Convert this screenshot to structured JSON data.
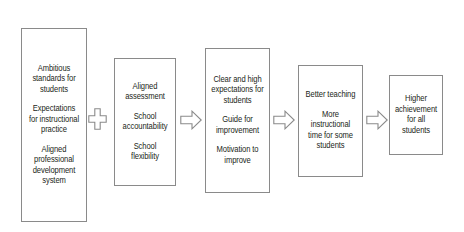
{
  "diagram": {
    "background": "#ffffff",
    "border_color": "#8a8a8a",
    "text_color": "#231f20",
    "nodes": [
      {
        "id": "inputs",
        "name": "ambitious-standards-box",
        "groups": [
          {
            "lines": [
              "Ambitious",
              "standards for",
              "students"
            ]
          },
          {
            "lines": [
              "Expectations",
              "for instructional",
              "practice"
            ]
          },
          {
            "lines": [
              "Aligned",
              "professional",
              "development",
              "system"
            ]
          }
        ]
      },
      {
        "id": "accountability",
        "name": "aligned-assessment-box",
        "groups": [
          {
            "lines": [
              "Aligned",
              "assessment"
            ]
          },
          {
            "lines": [
              "School",
              "accountability"
            ]
          },
          {
            "lines": [
              "School",
              "flexibility"
            ]
          }
        ]
      },
      {
        "id": "expectations",
        "name": "clear-expectations-box",
        "groups": [
          {
            "lines": [
              "Clear and high",
              "expectations for",
              "students"
            ]
          },
          {
            "lines": [
              "Guide for",
              "improvement"
            ]
          },
          {
            "lines": [
              "Motivation to",
              "improve"
            ]
          }
        ]
      },
      {
        "id": "teaching",
        "name": "better-teaching-box",
        "groups": [
          {
            "lines": [
              "Better teaching"
            ]
          },
          {
            "lines": [
              "More",
              "instructional",
              "time for some",
              "students"
            ]
          }
        ]
      },
      {
        "id": "outcome",
        "name": "higher-achievement-box",
        "groups": [
          {
            "lines": [
              "Higher",
              "achievement",
              "for all",
              "students"
            ]
          }
        ]
      }
    ],
    "connectors": [
      {
        "id": "plus-1",
        "name": "plus-connector",
        "glyph": "plus",
        "label": "plus"
      },
      {
        "id": "arrow-1",
        "name": "arrow-connector-right-1",
        "glyph": "arrow-right",
        "label": "leads to"
      },
      {
        "id": "arrow-2",
        "name": "arrow-connector-right-2",
        "glyph": "arrow-right",
        "label": "leads to"
      },
      {
        "id": "arrow-3",
        "name": "arrow-connector-right-3",
        "glyph": "arrow-right",
        "label": "leads to"
      }
    ]
  }
}
